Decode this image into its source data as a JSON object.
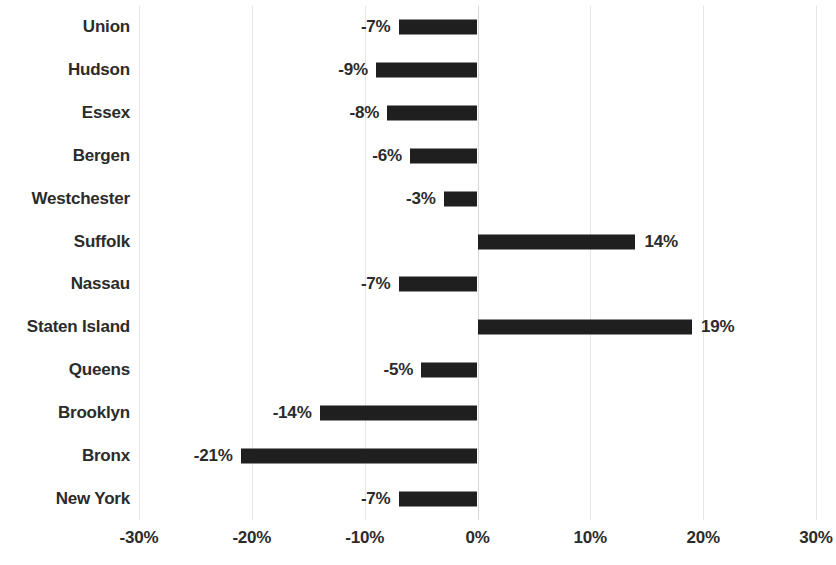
{
  "chart_data": {
    "type": "bar",
    "orientation": "horizontal",
    "title": "",
    "subtitle": "",
    "xlabel": "",
    "ylabel": "",
    "xlim": [
      -30,
      30
    ],
    "xticks": [
      -30,
      -20,
      -10,
      0,
      10,
      20,
      30
    ],
    "xtick_labels": [
      "-30%",
      "-20%",
      "-10%",
      "0%",
      "10%",
      "20%",
      "30%"
    ],
    "grid": true,
    "legend": false,
    "bar_color": "#1f1f1f",
    "gridline_color": "#e6e6e6",
    "text_color": "#2b2b2b",
    "categories": [
      "Union",
      "Hudson",
      "Essex",
      "Bergen",
      "Westchester",
      "Suffolk",
      "Nassau",
      "Staten Island",
      "Queens",
      "Brooklyn",
      "Bronx",
      "New York"
    ],
    "values": [
      -7,
      -9,
      -8,
      -6,
      -3,
      14,
      -7,
      19,
      -5,
      -14,
      -21,
      -7
    ],
    "data_labels": [
      "-7%",
      "-9%",
      "-8%",
      "-6%",
      "-3%",
      "14%",
      "-7%",
      "19%",
      "-5%",
      "-14%",
      "-21%",
      "-7%"
    ]
  }
}
